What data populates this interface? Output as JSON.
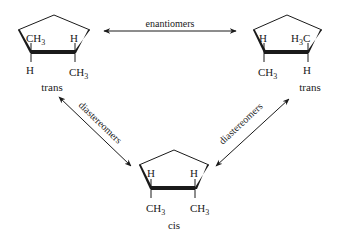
{
  "relations": {
    "top": "enantiomers",
    "left": "diastereomers",
    "right": "diastereomers"
  },
  "molecules": {
    "left": {
      "name": "trans",
      "substituents": {
        "up_left": "CH",
        "up_left_sub": "3",
        "up_right": "H",
        "down_left": "H",
        "down_right": "CH",
        "down_right_sub": "3"
      }
    },
    "right": {
      "name": "trans",
      "substituents": {
        "up_left": "H",
        "up_right_pre": "H",
        "up_right_sub": "3",
        "up_right_post": "C",
        "down_left": "CH",
        "down_left_sub": "3",
        "down_right": "H"
      }
    },
    "bottom": {
      "name": "cis",
      "substituents": {
        "up_left": "H",
        "up_right": "H",
        "down_left": "CH",
        "down_left_sub": "3",
        "down_right": "CH",
        "down_right_sub": "3"
      }
    }
  },
  "colors": {
    "ink": "#1a1a1a",
    "background": "#ffffff"
  }
}
